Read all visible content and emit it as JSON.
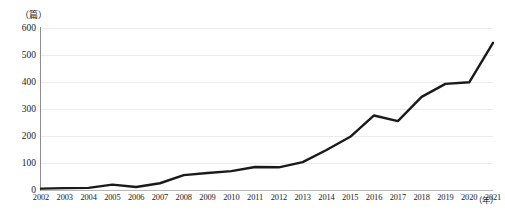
{
  "chart_data": {
    "type": "line",
    "title": "",
    "subtitle": "",
    "xlabel": "（年）",
    "ylabel": "（篇）",
    "y_unit_caption": "（篇）",
    "x_unit_caption": "（年）",
    "grid": "horizontal",
    "legend": "none",
    "legend_position": "none",
    "line_color": "#1a1a1a",
    "line_width": 2.4,
    "background_color": "#ffffff",
    "gridline_color": "#eceaea",
    "axis_color": "#8e8c8c",
    "xlim": [
      2002,
      2021
    ],
    "ylim": [
      0,
      600
    ],
    "ytick_values": [
      0,
      100,
      200,
      300,
      400,
      500,
      600
    ],
    "ytick_labels": [
      "0",
      "100",
      "200",
      "300",
      "400",
      "500",
      "600"
    ],
    "categories": [
      "2002",
      "2003",
      "2004",
      "2005",
      "2006",
      "2007",
      "2008",
      "2009",
      "2010",
      "2011",
      "2012",
      "2013",
      "2014",
      "2015",
      "2016",
      "2017",
      "2018",
      "2019",
      "2020",
      "2021"
    ],
    "x": [
      2002,
      2003,
      2004,
      2005,
      2006,
      2007,
      2008,
      2009,
      2010,
      2011,
      2012,
      2013,
      2014,
      2015,
      2016,
      2017,
      2018,
      2019,
      2020,
      2021
    ],
    "values": [
      5,
      7,
      8,
      20,
      11,
      25,
      55,
      63,
      70,
      85,
      84,
      103,
      148,
      197,
      276,
      255,
      345,
      393,
      399,
      545
    ],
    "series": [
      {
        "name": "发文量",
        "values": [
          5,
          7,
          8,
          20,
          11,
          25,
          55,
          63,
          70,
          85,
          84,
          103,
          148,
          197,
          276,
          255,
          345,
          393,
          399,
          545
        ]
      }
    ],
    "annotations": []
  }
}
